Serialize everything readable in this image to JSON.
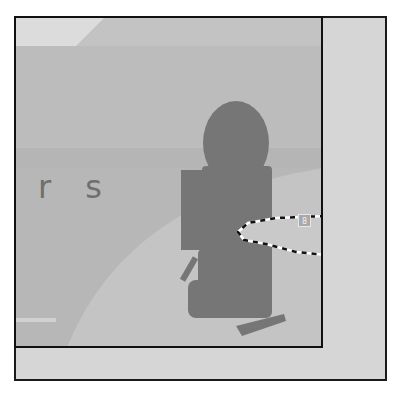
{
  "canvas": {
    "partial_text": "r s",
    "selection_badge": "8"
  },
  "colors": {
    "background": "#d6d6d6",
    "canvas": "#bdbdbd",
    "silhouette": "#777777",
    "frame": "#1a1a1a"
  }
}
